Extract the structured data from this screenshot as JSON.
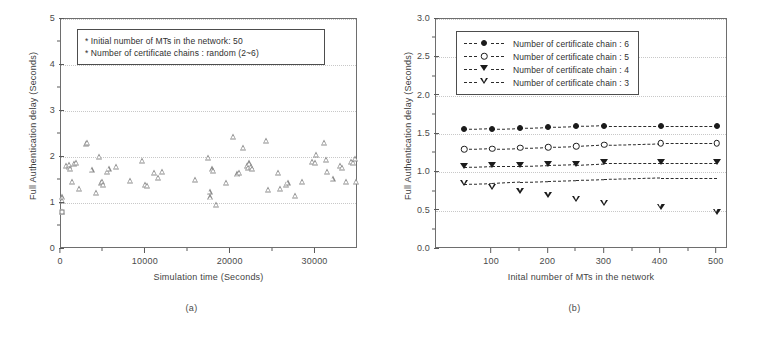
{
  "figure": {
    "panel_a_caption": "(a)",
    "panel_b_caption": "(b)"
  },
  "chart_data": [
    {
      "type": "scatter",
      "panel": "a",
      "title": "",
      "xlabel": "Simulation time (Seconds)",
      "ylabel": "Full Authentication delay (Seconds)",
      "xlim": [
        0,
        35000
      ],
      "ylim": [
        0,
        5
      ],
      "xticks": [
        0,
        10000,
        20000,
        30000
      ],
      "xtick_labels": [
        "0",
        "10000",
        "20000",
        "30000"
      ],
      "yticks": [
        0,
        1,
        2,
        3,
        4,
        5
      ],
      "ytick_labels": [
        "0",
        "1",
        "2",
        "3",
        "4",
        "5"
      ],
      "grid": true,
      "marker": "open-triangle-up",
      "annotations": [
        "* Initial number of MTs in the network: 50",
        "* Number of certificate chains : random (2~6)"
      ],
      "points": [
        {
          "x": 150,
          "y": 1.12
        },
        {
          "x": 160,
          "y": 1.05
        },
        {
          "x": 170,
          "y": 0.8
        },
        {
          "x": 600,
          "y": 1.8
        },
        {
          "x": 900,
          "y": 1.78
        },
        {
          "x": 1000,
          "y": 1.82
        },
        {
          "x": 1100,
          "y": 1.75
        },
        {
          "x": 1250,
          "y": 1.45
        },
        {
          "x": 1500,
          "y": 1.85
        },
        {
          "x": 1800,
          "y": 1.88
        },
        {
          "x": 2100,
          "y": 1.3
        },
        {
          "x": 2900,
          "y": 2.28
        },
        {
          "x": 3050,
          "y": 2.3
        },
        {
          "x": 3600,
          "y": 1.72
        },
        {
          "x": 4100,
          "y": 1.22
        },
        {
          "x": 4500,
          "y": 2.01
        },
        {
          "x": 4700,
          "y": 1.44
        },
        {
          "x": 4800,
          "y": 1.46
        },
        {
          "x": 5000,
          "y": 1.4
        },
        {
          "x": 5400,
          "y": 1.68
        },
        {
          "x": 5600,
          "y": 1.75
        },
        {
          "x": 6500,
          "y": 1.78
        },
        {
          "x": 8100,
          "y": 1.48
        },
        {
          "x": 9600,
          "y": 1.92
        },
        {
          "x": 9900,
          "y": 1.4
        },
        {
          "x": 10100,
          "y": 1.38
        },
        {
          "x": 11000,
          "y": 1.65
        },
        {
          "x": 11400,
          "y": 1.55
        },
        {
          "x": 11900,
          "y": 1.68
        },
        {
          "x": 15800,
          "y": 1.5
        },
        {
          "x": 17300,
          "y": 1.97
        },
        {
          "x": 17500,
          "y": 1.25
        },
        {
          "x": 17600,
          "y": 1.12
        },
        {
          "x": 17800,
          "y": 1.73
        },
        {
          "x": 17900,
          "y": 1.7
        },
        {
          "x": 18300,
          "y": 0.96
        },
        {
          "x": 19400,
          "y": 1.44
        },
        {
          "x": 20300,
          "y": 2.44
        },
        {
          "x": 20700,
          "y": 1.62
        },
        {
          "x": 21000,
          "y": 1.66
        },
        {
          "x": 21500,
          "y": 2.19
        },
        {
          "x": 21900,
          "y": 1.8
        },
        {
          "x": 22000,
          "y": 1.76
        },
        {
          "x": 22200,
          "y": 1.86
        },
        {
          "x": 22400,
          "y": 1.78
        },
        {
          "x": 22500,
          "y": 1.74
        },
        {
          "x": 24200,
          "y": 2.35
        },
        {
          "x": 24400,
          "y": 1.28
        },
        {
          "x": 25600,
          "y": 1.65
        },
        {
          "x": 25800,
          "y": 1.3
        },
        {
          "x": 26500,
          "y": 1.4
        },
        {
          "x": 26700,
          "y": 1.44
        },
        {
          "x": 27600,
          "y": 1.15
        },
        {
          "x": 28400,
          "y": 1.46
        },
        {
          "x": 29600,
          "y": 1.9
        },
        {
          "x": 29900,
          "y": 1.88
        },
        {
          "x": 30100,
          "y": 2.04
        },
        {
          "x": 31000,
          "y": 2.3
        },
        {
          "x": 31200,
          "y": 1.93
        },
        {
          "x": 31400,
          "y": 1.68
        },
        {
          "x": 32000,
          "y": 1.52
        },
        {
          "x": 32900,
          "y": 1.8
        },
        {
          "x": 33100,
          "y": 1.76
        },
        {
          "x": 33600,
          "y": 1.46
        },
        {
          "x": 34200,
          "y": 1.9
        },
        {
          "x": 34400,
          "y": 1.88
        },
        {
          "x": 34700,
          "y": 1.96
        },
        {
          "x": 34800,
          "y": 1.46
        }
      ]
    },
    {
      "type": "line",
      "panel": "b",
      "title": "",
      "xlabel": "Inital number of MTs in the network",
      "ylabel": "Full Authentication delay (Seconds)",
      "xlim": [
        0,
        520
      ],
      "ylim": [
        0.0,
        3.0
      ],
      "xticks": [
        100,
        200,
        300,
        400,
        500
      ],
      "xtick_labels": [
        "100",
        "200",
        "300",
        "400",
        "500"
      ],
      "yticks": [
        0.0,
        0.5,
        1.0,
        1.5,
        2.0,
        2.5,
        3.0
      ],
      "ytick_labels": [
        "0.0",
        "0.5",
        "1.0",
        "1.5",
        "2.0",
        "2.5",
        "3.0"
      ],
      "grid": true,
      "legend_position": "upper-left",
      "x": [
        50,
        100,
        150,
        200,
        250,
        300,
        400,
        500
      ],
      "series": [
        {
          "name": "Number of certificate chain : 6",
          "marker": "filled-circle",
          "values": [
            1.56,
            1.57,
            1.58,
            1.59,
            1.6,
            1.61,
            1.61,
            1.61
          ]
        },
        {
          "name": "Number of certificate chain : 5",
          "marker": "open-circle",
          "values": [
            1.3,
            1.31,
            1.32,
            1.33,
            1.34,
            1.36,
            1.38,
            1.38
          ]
        },
        {
          "name": "Number of certificate chain : 4",
          "marker": "filled-triangle-down",
          "values": [
            1.07,
            1.08,
            1.08,
            1.09,
            1.1,
            1.12,
            1.12,
            1.12
          ]
        },
        {
          "name": "Number of certificate chain : 3",
          "marker": "open-triangle-down",
          "values": [
            0.85,
            0.86,
            0.88,
            0.89,
            0.9,
            0.91,
            0.93,
            0.93
          ]
        }
      ]
    }
  ]
}
